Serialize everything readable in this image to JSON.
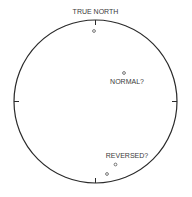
{
  "diagram": {
    "type": "stereonet-polar-plot",
    "title": "TRUE NORTH",
    "points": [
      {
        "id": "north-pole-point",
        "label": ""
      },
      {
        "id": "normal-point",
        "label": "NORMAL?"
      },
      {
        "id": "reversed-point-1",
        "label": "REVERSED?"
      },
      {
        "id": "reversed-point-2",
        "label": ""
      }
    ],
    "colors": {
      "line": "#2a2a2a",
      "text": "#3a3a3a",
      "background": "#ffffff"
    }
  }
}
